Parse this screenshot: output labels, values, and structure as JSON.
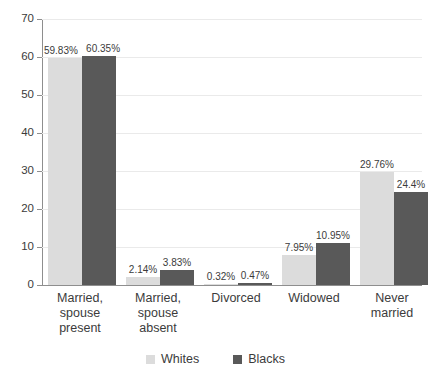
{
  "chart_data": {
    "type": "bar",
    "title": "",
    "subtitle": "",
    "xlabel": "",
    "ylabel": "",
    "ylim": [
      0,
      70
    ],
    "ytick_step": 10,
    "ytick_labels": [
      "0",
      "10",
      "20",
      "30",
      "40",
      "50",
      "60",
      "70"
    ],
    "grid": true,
    "legend_position": "bottom-center",
    "categories": [
      "Married,\nspouse\npresent",
      "Married,\nspouse\nabsent",
      "Divorced",
      "Widowed",
      "Never\nmarried"
    ],
    "series": [
      {
        "name": "Whites",
        "color": "#dcdcdc",
        "values": [
          59.83,
          2.14,
          0.32,
          7.95,
          29.76
        ],
        "data_labels": [
          "59.83%",
          "2.14%",
          "0.32%",
          "7.95%",
          "29.76%"
        ]
      },
      {
        "name": "Blacks",
        "color": "#595959",
        "values": [
          60.35,
          3.83,
          0.47,
          10.95,
          24.4
        ],
        "data_labels": [
          "60.35%",
          "3.83%",
          "0.47%",
          "10.95%",
          "24.4%"
        ]
      }
    ]
  },
  "legend": {
    "items": [
      {
        "label": "Whites",
        "swatch": "whites-swatch"
      },
      {
        "label": "Blacks",
        "swatch": "blacks-swatch"
      }
    ]
  },
  "colors": {
    "whites_bar": "#dcdcdc",
    "blacks_bar": "#595959",
    "gridline": "#eaeaea",
    "axis": "#8e8e8e",
    "text": "#3b3b3b",
    "background": "#ffffff"
  }
}
